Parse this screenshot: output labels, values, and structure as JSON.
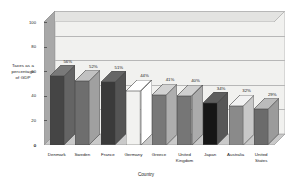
{
  "chart_data": {
    "type": "bar",
    "title": "",
    "xlabel": "Country",
    "ylabel": "Taxes as a percentage of GDP",
    "ylabel_lines": [
      "Taxes as a",
      "percentage",
      "of GDP"
    ],
    "ylim": [
      0,
      100
    ],
    "yticks": [
      0,
      20,
      40,
      60,
      80,
      100
    ],
    "ytick_labels": [
      "0",
      "20",
      "40",
      "60",
      "80",
      "100"
    ],
    "grid": true,
    "legend": "none",
    "style": "3d-bar",
    "categories": [
      "Denmark",
      "Sweden",
      "France",
      "Germany",
      "Greece",
      "United Kingdom",
      "Japan",
      "Australia",
      "United States"
    ],
    "category_lines": [
      [
        "Denmark"
      ],
      [
        "Sweden"
      ],
      [
        "France"
      ],
      [
        "Germany"
      ],
      [
        "Greece"
      ],
      [
        "United",
        "Kingdom"
      ],
      [
        "Japan"
      ],
      [
        "Australia"
      ],
      [
        "United",
        "States"
      ]
    ],
    "values": [
      56,
      52,
      51,
      44,
      41,
      40,
      34,
      32,
      29
    ],
    "data_labels": [
      "56%",
      "52%",
      "51%",
      "44%",
      "41%",
      "40%",
      "34%",
      "32%",
      "29%"
    ],
    "bar_colors": [
      "#454545",
      "#6e6e6e",
      "#3a3a3a",
      "#f2f2f0",
      "#787878",
      "#767676",
      "#161616",
      "#8a8a8a",
      "#6b6b6b"
    ]
  },
  "colors": {
    "plot_background": "#f4f4f2",
    "back_wall": "#f1f1ef",
    "left_wall": "#a8a8a8",
    "floor": "#c9c9c9",
    "gridline": "#b7b7b7",
    "axis": "#6a6a6a",
    "text": "#1a1a1a"
  }
}
